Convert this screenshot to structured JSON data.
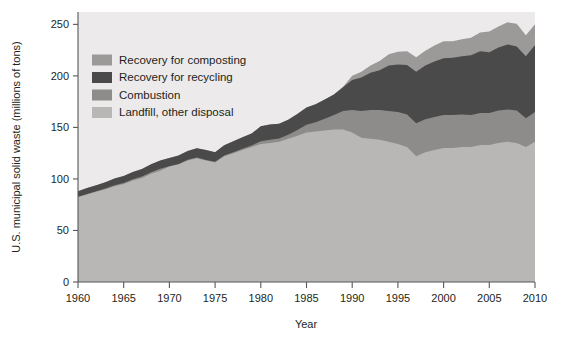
{
  "chart_data": {
    "type": "area",
    "title": "",
    "subtitle": "",
    "xlabel": "Year",
    "ylabel": "U.S. municipal solid waste (millions of tons)",
    "xlim": [
      1960,
      2010
    ],
    "ylim": [
      0,
      262
    ],
    "grid": false,
    "stacked": true,
    "legend_position": "top-left inside plot",
    "xticks": [
      1960,
      1965,
      1970,
      1975,
      1980,
      1985,
      1990,
      1995,
      2000,
      2005,
      2010
    ],
    "yticks": [
      0,
      50,
      100,
      150,
      200,
      250
    ],
    "x": [
      1960,
      1961,
      1962,
      1963,
      1964,
      1965,
      1966,
      1967,
      1968,
      1969,
      1970,
      1971,
      1972,
      1973,
      1974,
      1975,
      1976,
      1977,
      1978,
      1979,
      1980,
      1981,
      1982,
      1983,
      1984,
      1985,
      1986,
      1987,
      1988,
      1989,
      1990,
      1991,
      1992,
      1993,
      1994,
      1995,
      1996,
      1997,
      1998,
      1999,
      2000,
      2001,
      2002,
      2003,
      2004,
      2005,
      2006,
      2007,
      2008,
      2009,
      2010
    ],
    "series": [
      {
        "name": "Landfill, other disposal",
        "color": "#b9b7b5",
        "order": 1,
        "values": [
          82.5,
          85.0,
          87.5,
          90.0,
          93.0,
          95.0,
          98.5,
          101.0,
          105.0,
          108.0,
          112.0,
          114.0,
          118.0,
          120.0,
          118.0,
          116.0,
          122.0,
          125.0,
          128.0,
          131.0,
          134.0,
          135.0,
          136.0,
          139.0,
          142.0,
          145.0,
          146.0,
          147.0,
          148.0,
          148.0,
          145.0,
          140.0,
          139.0,
          138.0,
          136.0,
          134.0,
          131.0,
          122.0,
          126.0,
          128.0,
          130.0,
          130.0,
          131.0,
          131.0,
          133.0,
          133.0,
          135.0,
          136.0,
          135.0,
          131.0,
          136.0
        ]
      },
      {
        "name": "Combustion",
        "color": "#8e8c8a",
        "order": 2,
        "values": [
          0.0,
          0.3,
          0.5,
          0.7,
          0.9,
          1.0,
          1.2,
          1.4,
          1.6,
          1.8,
          0.4,
          0.5,
          0.6,
          0.7,
          0.5,
          0.7,
          0.8,
          1.0,
          1.4,
          1.5,
          2.7,
          3.0,
          3.3,
          4.0,
          5.5,
          7.6,
          9.0,
          11.5,
          14.0,
          18.0,
          22.0,
          26.0,
          28.0,
          29.0,
          30.0,
          31.0,
          31.5,
          32.0,
          32.0,
          32.0,
          32.0,
          32.0,
          31.5,
          31.0,
          31.0,
          31.0,
          31.5,
          31.5,
          31.5,
          28.0,
          29.0
        ]
      },
      {
        "name": "Recovery for recycling",
        "color": "#4b4a4a",
        "order": 3,
        "values": [
          5.6,
          5.8,
          6.0,
          6.2,
          6.5,
          6.8,
          7.0,
          7.3,
          7.6,
          8.0,
          8.0,
          8.2,
          8.5,
          9.0,
          9.5,
          9.3,
          10.0,
          10.5,
          11.0,
          11.5,
          14.5,
          14.8,
          14.3,
          14.5,
          15.5,
          16.7,
          17.5,
          18.5,
          20.0,
          23.0,
          29.0,
          32.5,
          36.0,
          38.5,
          44.0,
          46.0,
          48.0,
          50.0,
          52.0,
          54.0,
          55.0,
          55.5,
          56.5,
          58.0,
          60.0,
          59.0,
          61.0,
          63.0,
          62.0,
          60.0,
          65.0
        ]
      },
      {
        "name": "Recovery for composting",
        "color": "#9c9a98",
        "order": 4,
        "values": [
          0.0,
          0.0,
          0.0,
          0.0,
          0.0,
          0.0,
          0.0,
          0.0,
          0.0,
          0.0,
          0.0,
          0.0,
          0.0,
          0.0,
          0.0,
          0.0,
          0.0,
          0.0,
          0.0,
          0.0,
          0.0,
          0.0,
          0.0,
          0.0,
          0.0,
          0.0,
          0.0,
          0.0,
          0.0,
          0.5,
          4.2,
          5.5,
          7.0,
          9.0,
          11.0,
          12.5,
          13.5,
          14.0,
          14.5,
          15.5,
          16.5,
          16.0,
          16.5,
          17.0,
          18.0,
          20.0,
          20.5,
          21.5,
          22.0,
          20.5,
          20.0
        ]
      }
    ]
  },
  "legend": {
    "entries": [
      {
        "label": "Recovery for composting",
        "color": "#9c9a98"
      },
      {
        "label": "Recovery for recycling",
        "color": "#4b4a4a"
      },
      {
        "label": "Combustion",
        "color": "#8e8c8a"
      },
      {
        "label": "Landfill, other disposal",
        "color": "#b9b7b5"
      }
    ]
  },
  "axes": {
    "y_title": "U.S. municipal solid waste (millions of tons)",
    "x_title": "Year",
    "y_tick_labels": [
      "250",
      "200",
      "150",
      "100",
      "50",
      "0"
    ],
    "x_tick_labels": [
      "1960",
      "1965",
      "1970",
      "1975",
      "1980",
      "1985",
      "1990",
      "1995",
      "2000",
      "2005",
      "2010"
    ]
  },
  "colors": {
    "plot_background": "#eceaea",
    "axis": "#58585a",
    "text": "#231f20",
    "page_background": "#ffffff"
  }
}
